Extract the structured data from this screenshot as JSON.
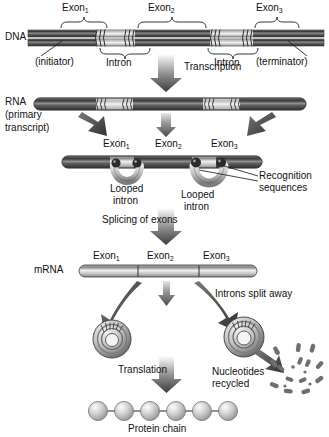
{
  "diagram": {
    "colors": {
      "exon_dark": "#555555",
      "intron_light": "#cfcfcf",
      "arrow_dark": "#4a4a4a",
      "text": "#111111",
      "line": "#333333",
      "bead": "#c9c9c9"
    }
  },
  "stages": {
    "dna": {
      "label": "DNA",
      "exon_labels": [
        "Exon",
        "Exon",
        "Exon"
      ],
      "exon_subs": [
        "1",
        "2",
        "3"
      ],
      "intron_labels": [
        "Intron",
        "Intron"
      ],
      "initiator": "(initiator)",
      "terminator": "(terminator)"
    },
    "transcription": {
      "label": "Transcription"
    },
    "rna": {
      "label_line1": "RNA",
      "label_line2": "(primary",
      "label_line3": "transcript)",
      "exon_labels": [
        "Exon",
        "Exon",
        "Exon"
      ],
      "exon_subs": [
        "1",
        "2",
        "3"
      ]
    },
    "looped": {
      "looped_intron_1_line1": "Looped",
      "looped_intron_1_line2": "intron",
      "looped_intron_2_line1": "Looped",
      "looped_intron_2_line2": "intron",
      "recognition_line1": "Recognition",
      "recognition_line2": "sequences"
    },
    "splicing": {
      "label": "Splicing of exons"
    },
    "mrna": {
      "label": "mRNA",
      "exon_labels": [
        "Exon",
        "Exon",
        "Exon"
      ],
      "exon_subs": [
        "1",
        "2",
        "3"
      ]
    },
    "introns_split": {
      "label": "Introns split away"
    },
    "translation": {
      "label": "Translation"
    },
    "nucleotides": {
      "line1": "Nucleotides",
      "line2": "recycled"
    },
    "protein": {
      "label": "Protein chain",
      "bead_count": 6
    }
  }
}
